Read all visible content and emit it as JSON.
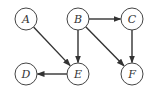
{
  "diagram": {
    "type": "directed-graph",
    "nodes": [
      {
        "id": "A",
        "label": "A",
        "x": 26,
        "y": 19
      },
      {
        "id": "B",
        "label": "B",
        "x": 78,
        "y": 19
      },
      {
        "id": "C",
        "label": "C",
        "x": 132,
        "y": 19
      },
      {
        "id": "D",
        "label": "D",
        "x": 26,
        "y": 74
      },
      {
        "id": "E",
        "label": "E",
        "x": 78,
        "y": 74
      },
      {
        "id": "F",
        "label": "F",
        "x": 132,
        "y": 74
      }
    ],
    "edges": [
      {
        "from": "A",
        "to": "E"
      },
      {
        "from": "B",
        "to": "C"
      },
      {
        "from": "B",
        "to": "E"
      },
      {
        "from": "B",
        "to": "F"
      },
      {
        "from": "C",
        "to": "F"
      },
      {
        "from": "E",
        "to": "D"
      }
    ],
    "node_radius": 11,
    "colors": {
      "stroke": "#444444",
      "edge": "#333333",
      "label": "#333333",
      "background": "#ffffff"
    }
  }
}
